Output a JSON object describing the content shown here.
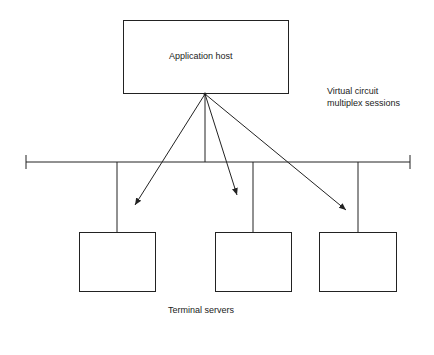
{
  "diagram": {
    "host": {
      "label": "Application host"
    },
    "sessions_label": {
      "line1": "Virtual circuit",
      "line2": "multiplex sessions"
    },
    "terminals": {
      "label": "Terminal servers",
      "count": 3
    },
    "colors": {
      "stroke": "#222222",
      "background": "#ffffff"
    }
  }
}
